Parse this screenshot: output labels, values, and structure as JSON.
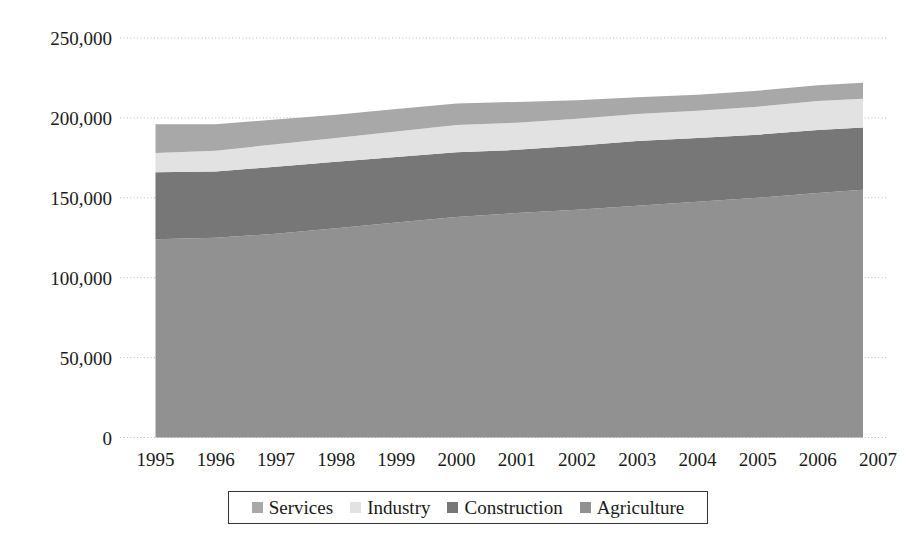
{
  "chart_data": {
    "type": "area",
    "stacked": true,
    "title": "",
    "subtitle": "",
    "xlabel": "",
    "ylabel": "",
    "grid": true,
    "legend_position": "bottom",
    "xlim": [
      1995,
      2007
    ],
    "ylim": [
      0,
      250000
    ],
    "x": [
      1995,
      1996,
      1997,
      1998,
      1999,
      2000,
      2001,
      2002,
      2003,
      2004,
      2005,
      2006,
      2006.75
    ],
    "categories": [
      "1995",
      "1996",
      "1997",
      "1998",
      "1999",
      "2000",
      "2001",
      "2002",
      "2003",
      "2004",
      "2005",
      "2006",
      "2007"
    ],
    "xtick_labels": [
      "1995",
      "1996",
      "1997",
      "1998",
      "1999",
      "2000",
      "2001",
      "2002",
      "2003",
      "2004",
      "2005",
      "2006",
      "2007"
    ],
    "ytick_labels": [
      "0",
      "50,000",
      "100,000",
      "150,000",
      "200,000",
      "250,000"
    ],
    "ytick_values": [
      0,
      50000,
      100000,
      150000,
      200000,
      250000
    ],
    "series": [
      {
        "name": "Agriculture",
        "color": "#919191",
        "values": [
          124000,
          125000,
          127500,
          131000,
          134500,
          138000,
          140500,
          142500,
          145000,
          147500,
          150000,
          153000,
          155000
        ]
      },
      {
        "name": "Construction",
        "color": "#777777",
        "values": [
          42000,
          41500,
          42000,
          41500,
          41000,
          40500,
          39500,
          40000,
          40500,
          40000,
          39500,
          39500,
          39000
        ]
      },
      {
        "name": "Industry",
        "color": "#e2e2e2",
        "values": [
          12000,
          13000,
          14000,
          15000,
          16000,
          17000,
          17000,
          17000,
          17000,
          17000,
          17500,
          18000,
          18000
        ]
      },
      {
        "name": "Services",
        "color": "#a8a8a8",
        "values": [
          18000,
          16500,
          15500,
          14500,
          14000,
          13500,
          13000,
          11500,
          10500,
          10000,
          10000,
          10000,
          10000
        ]
      }
    ],
    "stack_order_bottom_to_top": [
      "Agriculture",
      "Construction",
      "Industry",
      "Services"
    ],
    "stacked_totals": [
      196000,
      196000,
      199000,
      202000,
      205500,
      209000,
      210000,
      211000,
      213000,
      214500,
      217000,
      220500,
      222000
    ]
  },
  "legend": {
    "items": [
      {
        "label": "Services",
        "color": "#a8a8a8"
      },
      {
        "label": "Industry",
        "color": "#e2e2e2"
      },
      {
        "label": "Construction",
        "color": "#777777"
      },
      {
        "label": "Agriculture",
        "color": "#919191"
      }
    ]
  },
  "colors": {
    "services": "#a8a8a8",
    "industry": "#e2e2e2",
    "construction": "#777777",
    "agriculture": "#919191",
    "gridline": "#b9b9b9",
    "text": "#1a1a1a",
    "background": "#ffffff"
  }
}
